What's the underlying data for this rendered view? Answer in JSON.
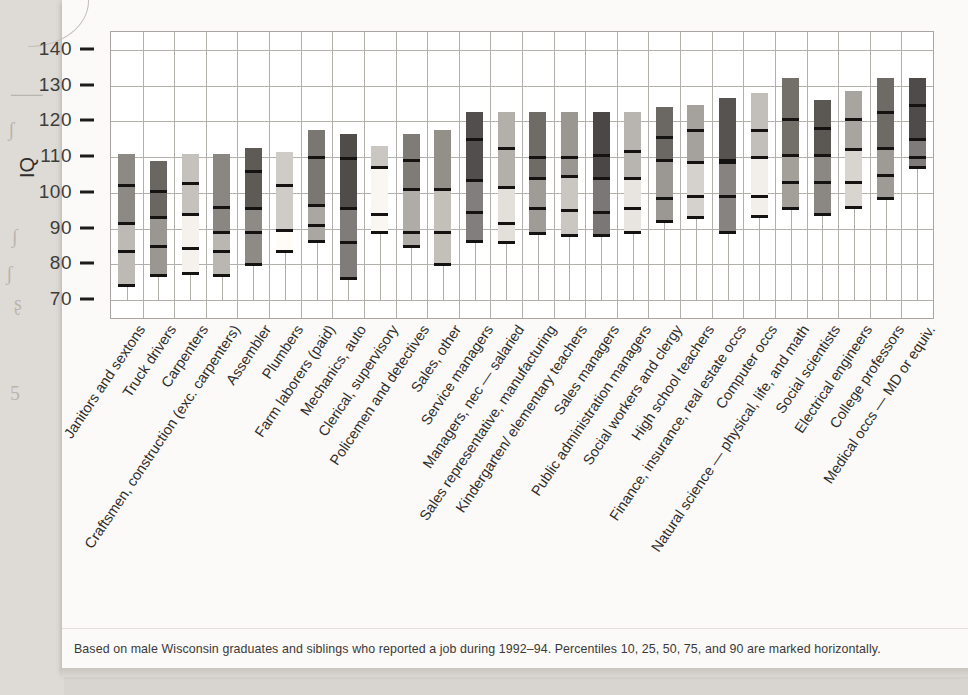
{
  "figure": {
    "y_axis_title": "IQ",
    "caption": "Based on male Wisconsin graduates and siblings who reported a job during 1992–94. Percentiles 10, 25, 50, 75, and 90 are marked horizontally."
  },
  "margin_marks": [
    "⸺",
    "ʃ",
    "∫",
    "ʃ",
    "ʂ",
    "5"
  ],
  "chart_data": {
    "type": "bar",
    "title": "",
    "subtitle": "",
    "xlabel": "",
    "ylabel": "IQ",
    "ylim": [
      65,
      145
    ],
    "yticks": [
      70,
      80,
      90,
      100,
      110,
      120,
      130,
      140
    ],
    "grid": true,
    "legend": "none",
    "percentiles": [
      10,
      25,
      50,
      75,
      90
    ],
    "categories": [
      "Janitors and sextons",
      "Truck drivers",
      "Carpenters",
      "Craftsmen, construction (exc. carpenters)",
      "Assembler",
      "Plumbers",
      "Farm laborers (paid)",
      "Mechanics, auto",
      "Clerical, supervisory",
      "Policemen and detectives",
      "Sales, other",
      "Service managers",
      "Managers, nec — salaried",
      "Sales representative, manufacturing",
      "Kindergarten/ elementary teachers",
      "Sales managers",
      "Public administration managers",
      "Social workers and clergy",
      "High school teachers",
      "Finance, insurance, real estate occs",
      "Computer occs",
      "Natural science — physical, life, and math",
      "Social scientists",
      "Electrical engineers",
      "College professors",
      "Medical occs — MD or equiv."
    ],
    "series": [
      {
        "name": "p10",
        "values": [
          74.0,
          77.0,
          77.5,
          77.0,
          80.0,
          83.5,
          86.5,
          76.0,
          89.0,
          85.0,
          80.0,
          86.5,
          86.0,
          88.5,
          88.0,
          88.0,
          89.0,
          92.0,
          93.0,
          89.0,
          93.5,
          95.5,
          94.0,
          96.0,
          98.5,
          107.0
        ]
      },
      {
        "name": "p25",
        "values": [
          83.5,
          85.0,
          84.5,
          83.5,
          89.0,
          89.5,
          91.0,
          86.0,
          94.0,
          89.0,
          89.0,
          94.5,
          91.5,
          95.5,
          95.0,
          94.5,
          95.5,
          98.5,
          99.0,
          99.0,
          99.0,
          103.0,
          103.0,
          103.0,
          105.0,
          110.0
        ]
      },
      {
        "name": "p50",
        "values": [
          91.5,
          93.0,
          94.0,
          89.0,
          95.5,
          89.5,
          96.5,
          95.5,
          107.0,
          101.0,
          101.0,
          103.5,
          101.5,
          104.0,
          104.5,
          104.0,
          104.0,
          109.0,
          108.5,
          108.5,
          110.0,
          110.5,
          110.5,
          112.0,
          112.5,
          115.0
        ]
      },
      {
        "name": "p75",
        "values": [
          102.0,
          100.5,
          102.5,
          96.0,
          106.0,
          102.0,
          110.0,
          109.5,
          107.0,
          109.0,
          101.0,
          115.0,
          112.5,
          110.0,
          110.0,
          110.5,
          111.5,
          115.5,
          117.5,
          109.0,
          117.5,
          120.5,
          118.0,
          120.5,
          122.5,
          124.5
        ]
      },
      {
        "name": "p90",
        "values": [
          111.0,
          109.0,
          111.0,
          111.0,
          112.5,
          111.5,
          117.5,
          116.5,
          113.0,
          116.5,
          117.5,
          122.5,
          122.5,
          122.5,
          122.5,
          122.5,
          122.5,
          124.0,
          124.5,
          126.5,
          128.0,
          132.0,
          126.0,
          128.5,
          132.0,
          132.0
        ]
      }
    ],
    "bar_shades": [
      "#8d8a85",
      "#6a6763",
      "#c5c2bd",
      "#8a8782",
      "#5e5b57",
      "#cfccc7",
      "#7a7773",
      "#4f4c49",
      "#cac7c2",
      "#7f7c78",
      "#939089",
      "#514e4b",
      "#b3b0ab",
      "#6f6c68",
      "#9a9792",
      "#4a4744",
      "#b8b5b0",
      "#6b6864",
      "#a5a29d",
      "#565350",
      "#c2bfba",
      "#737069",
      "#5b5854",
      "#a8a5a0",
      "#6e6b67",
      "#4e4b48"
    ],
    "box_upper_shade_delta": "#00000022"
  }
}
